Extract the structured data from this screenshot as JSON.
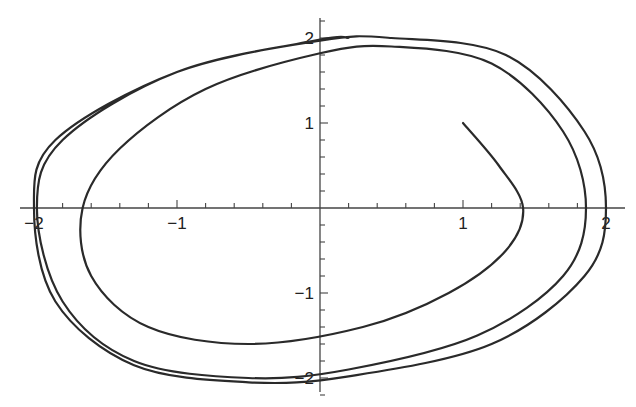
{
  "chart_data": {
    "type": "line",
    "title": "",
    "subtitle": "",
    "xlabel": "",
    "ylabel": "",
    "xlim": [
      -2.1,
      2.15
    ],
    "ylim": [
      -2.2,
      2.25
    ],
    "grid": false,
    "legend": null,
    "axes_through_origin": true,
    "x_ticks": {
      "major": [
        -2,
        -1,
        1,
        2
      ],
      "labels": [
        "−2",
        "−1",
        "1",
        "2"
      ],
      "minor_step": 0.2
    },
    "y_ticks": {
      "major": [
        -2,
        -1,
        1,
        2
      ],
      "labels": [
        "−2",
        "−1",
        "1",
        "2"
      ],
      "minor_step": 0.2
    },
    "series": [
      {
        "name": "trajectory",
        "start": [
          1.0,
          1.0
        ],
        "direction": "clockwise",
        "x": [
          1.0,
          1.25,
          1.42,
          1.3,
          0.9,
          0.3,
          -0.5,
          -1.2,
          -1.6,
          -1.66,
          -1.4,
          -0.8,
          0.0,
          0.5,
          1.2,
          1.7,
          1.86,
          1.7,
          1.1,
          0.2,
          -0.5,
          -1.3,
          -1.8,
          -1.98,
          -1.8,
          -1.0,
          0.0,
          0.5,
          1.3,
          1.85,
          2.0,
          1.85,
          1.2,
          0.2,
          -0.5,
          -1.3,
          -1.85,
          -2.0,
          -1.85,
          -1.0,
          0.0,
          0.2
        ],
        "y": [
          1.0,
          0.5,
          0.0,
          -0.5,
          -1.0,
          -1.4,
          -1.6,
          -1.4,
          -0.8,
          0.0,
          0.7,
          1.4,
          1.82,
          1.9,
          1.7,
          0.9,
          0.0,
          -0.8,
          -1.5,
          -1.9,
          -2.0,
          -1.8,
          -1.1,
          0.0,
          0.8,
          1.6,
          1.97,
          2.0,
          1.8,
          0.9,
          0.0,
          -0.8,
          -1.6,
          -1.98,
          -2.05,
          -1.85,
          -1.1,
          0.0,
          0.8,
          1.6,
          1.98,
          2.0
        ]
      }
    ]
  }
}
